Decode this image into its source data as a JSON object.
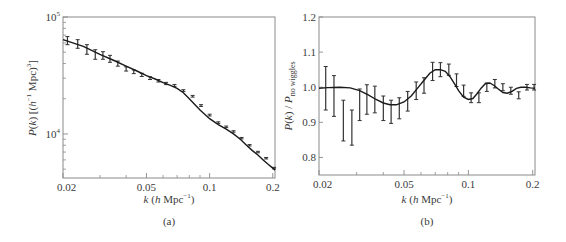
{
  "figure": {
    "panels": [
      {
        "caption": "(a)"
      },
      {
        "caption": "(b)"
      }
    ]
  },
  "chart_data": [
    {
      "type": "line",
      "panel": "(a)",
      "title": "",
      "xlabel": "k (h Mpc⁻¹)",
      "ylabel": "P(k) [(h⁻¹ Mpc)³]",
      "xscale": "log",
      "yscale": "log",
      "xlim": [
        0.02,
        0.205
      ],
      "ylim": [
        4200,
        100000
      ],
      "xticks": [
        0.02,
        0.05,
        0.1,
        0.2
      ],
      "xtick_labels": [
        "0.02",
        "0.05",
        "0.1",
        "0.2"
      ],
      "yticks": [
        10000,
        100000
      ],
      "ytick_labels": [
        "10⁴",
        "10⁵"
      ],
      "grid": false,
      "legend": null,
      "series": [
        {
          "name": "model",
          "style": "line",
          "x": [
            0.02,
            0.025,
            0.03,
            0.035,
            0.04,
            0.045,
            0.05,
            0.055,
            0.06,
            0.065,
            0.07,
            0.075,
            0.08,
            0.09,
            0.1,
            0.11,
            0.12,
            0.13,
            0.14,
            0.15,
            0.16,
            0.17,
            0.18,
            0.19,
            0.2,
            0.205
          ],
          "y": [
            64000,
            56000,
            48000,
            42500,
            38000,
            34500,
            31500,
            29500,
            27500,
            26000,
            24500,
            22500,
            20000,
            16000,
            13500,
            12000,
            11000,
            10000,
            9000,
            8000,
            7200,
            6600,
            6000,
            5500,
            5100,
            4900
          ]
        },
        {
          "name": "measurements",
          "style": "errorbar",
          "x": [
            0.021,
            0.0235,
            0.026,
            0.0285,
            0.031,
            0.0335,
            0.0365,
            0.04,
            0.0435,
            0.0475,
            0.052,
            0.057,
            0.062,
            0.068,
            0.075,
            0.083,
            0.091,
            0.1,
            0.11,
            0.12,
            0.13,
            0.142,
            0.155,
            0.17,
            0.186,
            0.203
          ],
          "y": [
            63000,
            59000,
            53000,
            48000,
            47000,
            44000,
            40000,
            36000,
            34000,
            32000,
            30000,
            28500,
            27000,
            26000,
            23500,
            21000,
            17500,
            14500,
            12500,
            11500,
            10500,
            9200,
            8000,
            7000,
            6200,
            5100
          ],
          "yerr": [
            5000,
            5000,
            5000,
            4500,
            3500,
            3000,
            2000,
            1500,
            1200,
            1000,
            800,
            700,
            600,
            500,
            400,
            350,
            300,
            250,
            200,
            180,
            150,
            130,
            110,
            100,
            90,
            80
          ]
        }
      ]
    },
    {
      "type": "line",
      "panel": "(b)",
      "title": "",
      "xlabel": "k (h Mpc⁻¹)",
      "ylabel": "P(k) / P_no wiggles",
      "xscale": "log",
      "yscale": "linear",
      "xlim": [
        0.02,
        0.205
      ],
      "ylim": [
        0.75,
        1.2
      ],
      "xticks": [
        0.02,
        0.05,
        0.1,
        0.2
      ],
      "xtick_labels": [
        "0.02",
        "0.05",
        "0.1",
        "0.2"
      ],
      "yticks": [
        0.8,
        0.9,
        1.0,
        1.1,
        1.2
      ],
      "ytick_labels": [
        "0.8",
        "0.9",
        "1.0",
        "1.1",
        "1.2"
      ],
      "grid": false,
      "legend": null,
      "series": [
        {
          "name": "model",
          "style": "line",
          "x": [
            0.02,
            0.022,
            0.025,
            0.028,
            0.031,
            0.034,
            0.037,
            0.04,
            0.043,
            0.046,
            0.05,
            0.054,
            0.058,
            0.062,
            0.066,
            0.07,
            0.074,
            0.078,
            0.082,
            0.086,
            0.09,
            0.095,
            0.1,
            0.105,
            0.11,
            0.115,
            0.12,
            0.126,
            0.132,
            0.138,
            0.145,
            0.152,
            0.16,
            0.168,
            0.176,
            0.185,
            0.195,
            0.205
          ],
          "y": [
            0.997,
            0.999,
            1.0,
            0.998,
            0.99,
            0.978,
            0.965,
            0.955,
            0.95,
            0.95,
            0.958,
            0.975,
            0.998,
            1.02,
            1.04,
            1.05,
            1.05,
            1.045,
            1.03,
            1.01,
            0.99,
            0.972,
            0.965,
            0.968,
            0.982,
            0.998,
            1.01,
            1.012,
            1.005,
            0.995,
            0.985,
            0.983,
            0.988,
            0.997,
            1.0,
            1.0,
            0.998,
            0.997
          ]
        },
        {
          "name": "measurements",
          "style": "errorbar",
          "x": [
            0.0215,
            0.0235,
            0.026,
            0.0285,
            0.031,
            0.0335,
            0.0365,
            0.04,
            0.0435,
            0.0475,
            0.052,
            0.057,
            0.062,
            0.068,
            0.074,
            0.081,
            0.088,
            0.095,
            0.103,
            0.112,
            0.122,
            0.133,
            0.145,
            0.158,
            0.172,
            0.188,
            0.203
          ],
          "y": [
            0.997,
            0.975,
            0.905,
            0.885,
            0.95,
            0.965,
            0.965,
            0.94,
            0.93,
            0.94,
            0.96,
            0.99,
            1.005,
            1.045,
            1.05,
            1.05,
            1.02,
            0.99,
            0.97,
            0.97,
            1.0,
            1.01,
            1.0,
            0.99,
            0.977,
            1.0,
            1.0
          ],
          "yerr": [
            0.062,
            0.058,
            0.058,
            0.05,
            0.045,
            0.042,
            0.038,
            0.035,
            0.033,
            0.03,
            0.028,
            0.025,
            0.022,
            0.026,
            0.02,
            0.016,
            0.018,
            0.016,
            0.014,
            0.014,
            0.012,
            0.012,
            0.01,
            0.01,
            0.01,
            0.008,
            0.008
          ]
        }
      ]
    }
  ]
}
